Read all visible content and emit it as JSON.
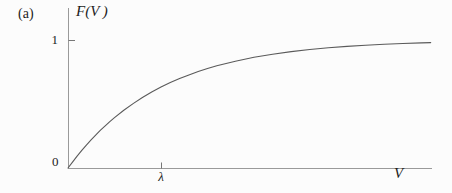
{
  "figure": {
    "panel_label": "(a)",
    "y_axis_title": "F(V )",
    "y_tick_label": "1",
    "origin_label": "0",
    "x_tick_label": "λ",
    "x_axis_title": "V"
  },
  "colors": {
    "background": "#fcfcfc",
    "axis": "#9a9a9a",
    "curve": "#5a5a5a",
    "text": "#1c1c1c"
  },
  "chart_data": {
    "type": "line",
    "title": "",
    "xlabel": "V",
    "ylabel": "F(V)",
    "panel": "(a)",
    "curve_shape": "F(V) = 1 - exp(-V/λ), cumulative saturating curve from 0 toward asymptote 1",
    "x_unit": "multiples of λ",
    "xlim": [
      0,
      3.9
    ],
    "ylim": [
      0,
      1.25
    ],
    "x_ticks": [
      {
        "value": 1,
        "label": "λ"
      }
    ],
    "y_ticks": [
      {
        "value": 1,
        "label": "1"
      }
    ],
    "origin_label": "0",
    "grid": false,
    "legend": "none",
    "series": [
      {
        "name": "F(V)",
        "points": [
          [
            0,
            0
          ],
          [
            0.05,
            0.0488
          ],
          [
            0.1,
            0.0952
          ],
          [
            0.15,
            0.1393
          ],
          [
            0.2,
            0.1813
          ],
          [
            0.25,
            0.2212
          ],
          [
            0.3,
            0.2592
          ],
          [
            0.35,
            0.2953
          ],
          [
            0.4,
            0.3297
          ],
          [
            0.45,
            0.3624
          ],
          [
            0.5,
            0.3935
          ],
          [
            0.6,
            0.4512
          ],
          [
            0.7,
            0.5034
          ],
          [
            0.8,
            0.5507
          ],
          [
            0.9,
            0.5934
          ],
          [
            1.0,
            0.6321
          ],
          [
            1.1,
            0.6671
          ],
          [
            1.2,
            0.6988
          ],
          [
            1.3,
            0.7275
          ],
          [
            1.4,
            0.7534
          ],
          [
            1.5,
            0.7769
          ],
          [
            1.6,
            0.7981
          ],
          [
            1.8,
            0.8347
          ],
          [
            2.0,
            0.8647
          ],
          [
            2.2,
            0.8892
          ],
          [
            2.4,
            0.9093
          ],
          [
            2.6,
            0.9257
          ],
          [
            2.8,
            0.9392
          ],
          [
            3.0,
            0.9502
          ],
          [
            3.2,
            0.9592
          ],
          [
            3.4,
            0.9666
          ],
          [
            3.6,
            0.9727
          ],
          [
            3.8,
            0.9776
          ],
          [
            3.9,
            0.9798
          ]
        ]
      }
    ],
    "plot_mapping_px": {
      "origin": [
        68,
        168
      ],
      "x_px_per_unit": 93,
      "y_px_per_unit": 128,
      "x_axis_end_px": 432,
      "y_axis_top_px": 8
    }
  }
}
